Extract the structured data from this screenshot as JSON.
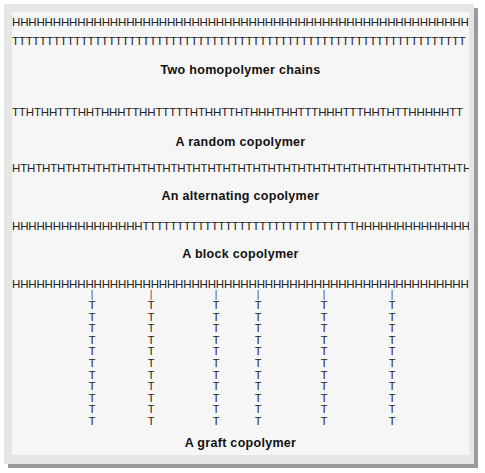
{
  "diagram": {
    "homopolymer": {
      "chain_h": "HHHHHHHHHHHHHHHHHHHHHHHHHHHHHHHHHHHHHHHHHHHHHHHHHHHHHHHHHHHHHHHH",
      "chain_t": "TTTTTTTTTTTTTTTTTTTTTTTTTTTTTTTTTTTTTTTTTTTTTTTTTTTTTTTTTTTTTTTTTT",
      "caption": "Two homopolymer chains"
    },
    "random": {
      "chain": "TTHTHHTTTHHTHHHTTHHTTTTTHTHHTTHTHHHTHHTTTHHHTTTHHTHTTHHHHHTT",
      "caption": "A random copolymer"
    },
    "alternating": {
      "chain": "HTHTHTHTHTHTHTHTHTHTHTHTHTHTHTHTHTHTHTHTHTHTHTHTHTHTHTHTHTHTHT",
      "caption": "An alternating copolymer"
    },
    "block": {
      "chain": "HHHHHHHHHHHHHHHHTTTTTTTTTTTTTTTTTTTTTTTTTTTTTTTHHHHHHHHHHHHHHHH",
      "caption": "A block copolymer"
    },
    "graft": {
      "backbone": "HHHHHHHHHHHHHHHHHHHHHHHHHHHHHHHHHHHHHHHHHHHHHHHHHHHHHHHHHHHHHHHH",
      "bond": "|",
      "branch_unit": "T",
      "branch_length": 11,
      "branch_count": 6,
      "caption": "A graft copolymer"
    }
  }
}
